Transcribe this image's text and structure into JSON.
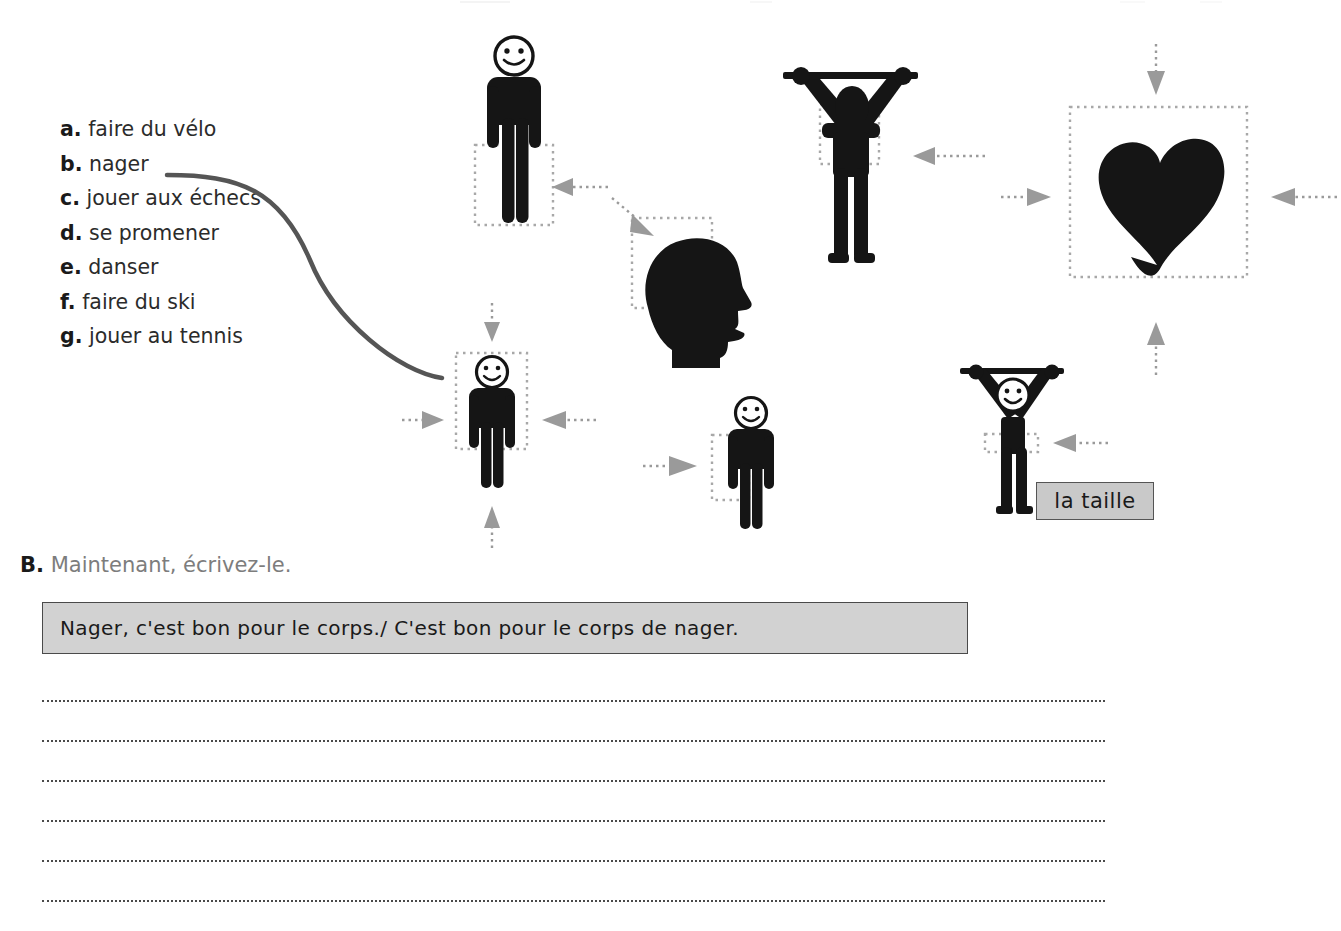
{
  "exercise": {
    "vocab_list": [
      {
        "letter": "a.",
        "text": "faire du vélo"
      },
      {
        "letter": "b.",
        "text": "nager"
      },
      {
        "letter": "c.",
        "text": "jouer aux échecs"
      },
      {
        "letter": "d.",
        "text": "se promener"
      },
      {
        "letter": "e.",
        "text": "danser"
      },
      {
        "letter": "f.",
        "text": "faire du ski"
      },
      {
        "letter": "g.",
        "text": "jouer au tennis"
      }
    ]
  },
  "diagram": {
    "taille_label": "la taille",
    "figures": [
      {
        "name": "standing-figure-legs-highlighted",
        "part": "legs"
      },
      {
        "name": "weightlifter-figure-torso-highlighted",
        "part": "torso"
      },
      {
        "name": "head-profile-brain-highlighted",
        "part": "head"
      },
      {
        "name": "heart-highlighted",
        "part": "heart"
      },
      {
        "name": "standing-figure-whole-body-highlighted",
        "part": "body"
      },
      {
        "name": "standing-figure-arm-highlighted",
        "part": "arm"
      },
      {
        "name": "weightlifter-figure-waist-highlighted",
        "part": "waist"
      }
    ]
  },
  "part_b": {
    "letter": "B.",
    "heading": "Maintenant, écrivez-le.",
    "answer_text": "Nager, c'est bon pour le corps./ C'est bon pour le corps de nager.",
    "blank_line_count": 6
  },
  "colors": {
    "figure_black": "#151515",
    "arrow_gray": "#9a9a9a",
    "dotted_box_gray": "#a8a8a8",
    "curve_gray": "#555555",
    "answer_box_fill": "#d2d2d2",
    "answer_box_border": "#4a4a4a",
    "taille_fill": "#c9c9c9",
    "heading_gray": "#7d7d7d"
  }
}
